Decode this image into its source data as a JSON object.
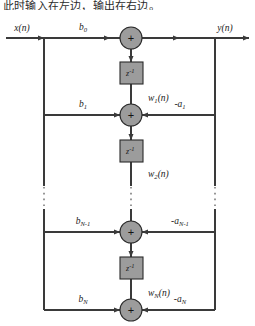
{
  "caption": "此时输入在左边，输出在右边。",
  "diagram": {
    "type": "signal-flow-graph",
    "name": "Direct Form II IIR filter structure",
    "colors": {
      "node_fill": "#9c9c9c",
      "node_stroke": "#2a2a2a",
      "line": "#3a3a3a",
      "text": "#1a1a1a",
      "background": "#ffffff"
    },
    "input": {
      "label": "x",
      "arg": "(n)"
    },
    "output": {
      "label": "y",
      "arg": "(n)"
    },
    "delay_label": {
      "base": "z",
      "exp": "-1"
    },
    "adder_symbol": "+",
    "feedforward_coeffs": [
      {
        "label": "b",
        "sub": "0"
      },
      {
        "label": "b",
        "sub": "1"
      },
      {
        "label": "b",
        "sub": "N-1"
      },
      {
        "label": "b",
        "sub": "N"
      }
    ],
    "feedback_coeffs": [
      {
        "label": "-a",
        "sub": "1"
      },
      {
        "label": "-a",
        "sub": "N-1"
      },
      {
        "label": "-a",
        "sub": "N"
      }
    ],
    "state_vars": [
      {
        "label": "w",
        "sub": "1",
        "arg": "(n)"
      },
      {
        "label": "w",
        "sub": "2",
        "arg": "(n)"
      },
      {
        "label": "w",
        "sub": "N",
        "arg": "(n)"
      }
    ],
    "continuation": "vertical-dots"
  }
}
